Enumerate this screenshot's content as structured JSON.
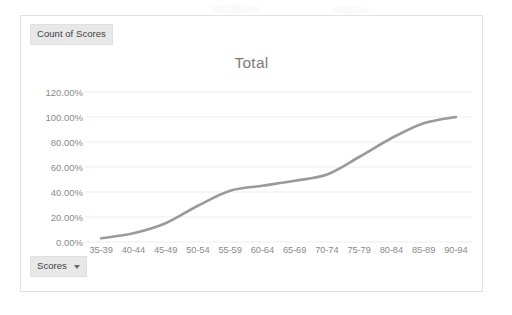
{
  "card": {
    "legend_field_label": "Count of Scores",
    "axis_field_label": "Scores",
    "axis_field_caret": "chevron-down-icon"
  },
  "chart_data": {
    "type": "line",
    "title": "Total",
    "xlabel": "",
    "ylabel": "",
    "ylim": [
      0,
      120
    ],
    "ytick_labels": [
      "120.00%",
      "100.00%",
      "80.00%",
      "60.00%",
      "40.00%",
      "20.00%",
      "0.00%"
    ],
    "ytick_values": [
      120,
      100,
      80,
      60,
      40,
      20,
      0
    ],
    "grid": true,
    "legend_position": "none",
    "series_name": "Count of Scores",
    "series_color": "#9a9a9a",
    "categories": [
      "35-39",
      "40-44",
      "45-49",
      "50-54",
      "55-59",
      "60-64",
      "65-69",
      "70-74",
      "75-79",
      "80-84",
      "85-89",
      "90-94"
    ],
    "values": [
      3,
      7,
      15,
      29,
      41,
      45,
      49,
      54,
      68,
      83,
      95,
      100
    ]
  }
}
